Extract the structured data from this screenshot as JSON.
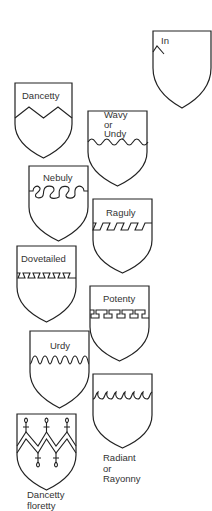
{
  "diagram": {
    "stroke_color": "#222222",
    "background": "#ffffff",
    "shields": [
      {
        "id": "partial",
        "label": "In",
        "pattern": "dancetty"
      },
      {
        "id": "dancetty",
        "label": "Dancetty",
        "pattern": "dancetty"
      },
      {
        "id": "wavy",
        "label_lines": [
          "Wavy",
          "or",
          "Undy"
        ],
        "pattern": "wavy"
      },
      {
        "id": "nebuly",
        "label": "Nebuly",
        "pattern": "nebuly"
      },
      {
        "id": "raguly",
        "label": "Raguly",
        "pattern": "raguly"
      },
      {
        "id": "dovetailed",
        "label": "Dovetailed",
        "pattern": "dovetailed"
      },
      {
        "id": "potenty",
        "label": "Potenty",
        "pattern": "potenty"
      },
      {
        "id": "urdy",
        "label": "Urdy",
        "pattern": "urdy"
      },
      {
        "id": "radiant",
        "label_lines": [
          "Radiant",
          "or",
          "Rayonny"
        ],
        "pattern": "rayonny"
      },
      {
        "id": "dancetty-floretty",
        "label_lines": [
          "Dancetty",
          "floretty"
        ],
        "pattern": "dancetty-floretty"
      }
    ]
  }
}
